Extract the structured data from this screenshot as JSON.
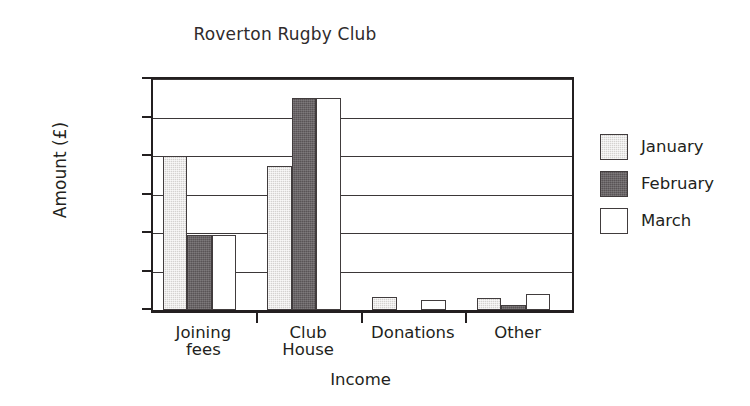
{
  "chart_data": {
    "type": "bar",
    "title": "Roverton Rugby Club",
    "xlabel": "Income",
    "ylabel": "Amount (£)",
    "categories": [
      "Joining fees",
      "Club House",
      "Donations",
      "Other"
    ],
    "category_lines": [
      [
        "Joining",
        "fees"
      ],
      [
        "Club",
        "House"
      ],
      [
        "Donations"
      ],
      [
        "Other"
      ]
    ],
    "series": [
      {
        "name": "January",
        "values": [
          4000,
          3750,
          330,
          300
        ],
        "color": "#d4d2d0"
      },
      {
        "name": "February",
        "values": [
          1950,
          5500,
          0,
          120
        ],
        "color": "#595456"
      },
      {
        "name": "March",
        "values": [
          1950,
          5500,
          260,
          420
        ],
        "color": "#ffffff"
      }
    ],
    "ylim": [
      0,
      6000
    ],
    "yticks": [
      0,
      1000,
      2000,
      3000,
      4000,
      5000,
      6000
    ],
    "ytick_labels": [
      "0",
      "1000",
      "2000",
      "3000",
      "4000",
      "5000",
      "6000"
    ],
    "grid": true,
    "grid_axis": "y",
    "legend_position": "right",
    "bar_edge_color": "#413c3d",
    "axis_color": "#231f20"
  }
}
